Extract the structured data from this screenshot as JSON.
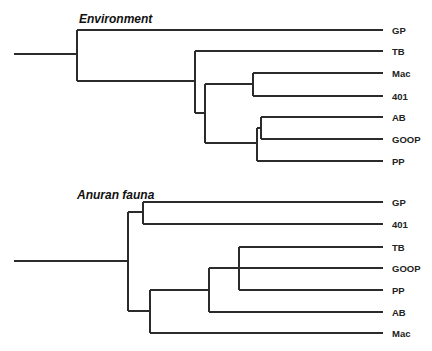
{
  "chart_data": {
    "type": "dendrogram",
    "panels": [
      {
        "id": "environment",
        "title": "Environment",
        "title_pos": [
          79,
          23
        ],
        "root_stem": {
          "x1": 14,
          "x2": 77,
          "y": 54
        },
        "leaf_end_x": 383,
        "label_x": 392,
        "leaves": [
          {
            "name": "GP",
            "y": 30
          },
          {
            "name": "TB",
            "y": 51
          },
          {
            "name": "Mac",
            "y": 73
          },
          {
            "name": "401",
            "y": 96
          },
          {
            "name": "AB",
            "y": 117
          },
          {
            "name": "GOOP",
            "y": 139
          },
          {
            "name": "PP",
            "y": 161
          }
        ],
        "segments": [
          {
            "x1": 77,
            "y1": 30,
            "x2": 77,
            "y2": 81
          },
          {
            "x1": 77,
            "y1": 30,
            "x2": 383,
            "y2": 30
          },
          {
            "x1": 77,
            "y1": 81,
            "x2": 195,
            "y2": 81
          },
          {
            "x1": 195,
            "y1": 51,
            "x2": 195,
            "y2": 113
          },
          {
            "x1": 195,
            "y1": 51,
            "x2": 383,
            "y2": 51
          },
          {
            "x1": 195,
            "y1": 113,
            "x2": 205,
            "y2": 113
          },
          {
            "x1": 205,
            "y1": 84,
            "x2": 205,
            "y2": 143
          },
          {
            "x1": 205,
            "y1": 84,
            "x2": 253,
            "y2": 84
          },
          {
            "x1": 253,
            "y1": 73,
            "x2": 253,
            "y2": 96
          },
          {
            "x1": 253,
            "y1": 73,
            "x2": 383,
            "y2": 73
          },
          {
            "x1": 253,
            "y1": 96,
            "x2": 383,
            "y2": 96
          },
          {
            "x1": 205,
            "y1": 143,
            "x2": 257,
            "y2": 143
          },
          {
            "x1": 257,
            "y1": 128,
            "x2": 257,
            "y2": 161
          },
          {
            "x1": 257,
            "y1": 128,
            "x2": 261,
            "y2": 128
          },
          {
            "x1": 261,
            "y1": 117,
            "x2": 261,
            "y2": 139
          },
          {
            "x1": 261,
            "y1": 117,
            "x2": 383,
            "y2": 117
          },
          {
            "x1": 261,
            "y1": 139,
            "x2": 383,
            "y2": 139
          },
          {
            "x1": 257,
            "y1": 161,
            "x2": 383,
            "y2": 161
          }
        ]
      },
      {
        "id": "anuran-fauna",
        "title": "Anuran fauna",
        "title_pos": [
          77,
          199
        ],
        "root_stem": {
          "x1": 14,
          "x2": 128,
          "y": 261
        },
        "leaf_end_x": 383,
        "label_x": 392,
        "leaves": [
          {
            "name": "GP",
            "y": 202
          },
          {
            "name": "401",
            "y": 224
          },
          {
            "name": "TB",
            "y": 247
          },
          {
            "name": "GOOP",
            "y": 268
          },
          {
            "name": "PP",
            "y": 290
          },
          {
            "name": "AB",
            "y": 312
          },
          {
            "name": "Mac",
            "y": 333
          }
        ],
        "segments": [
          {
            "x1": 128,
            "y1": 212,
            "x2": 128,
            "y2": 311
          },
          {
            "x1": 128,
            "y1": 212,
            "x2": 143,
            "y2": 212
          },
          {
            "x1": 143,
            "y1": 202,
            "x2": 143,
            "y2": 224
          },
          {
            "x1": 143,
            "y1": 202,
            "x2": 383,
            "y2": 202
          },
          {
            "x1": 143,
            "y1": 224,
            "x2": 383,
            "y2": 224
          },
          {
            "x1": 128,
            "y1": 311,
            "x2": 150,
            "y2": 311
          },
          {
            "x1": 150,
            "y1": 290,
            "x2": 150,
            "y2": 333
          },
          {
            "x1": 150,
            "y1": 333,
            "x2": 383,
            "y2": 333
          },
          {
            "x1": 150,
            "y1": 290,
            "x2": 209,
            "y2": 290
          },
          {
            "x1": 209,
            "y1": 268,
            "x2": 209,
            "y2": 312
          },
          {
            "x1": 209,
            "y1": 268,
            "x2": 383,
            "y2": 268
          },
          {
            "x1": 209,
            "y1": 312,
            "x2": 383,
            "y2": 312
          },
          {
            "x1": 239,
            "y1": 247,
            "x2": 239,
            "y2": 290
          },
          {
            "x1": 239,
            "y1": 247,
            "x2": 383,
            "y2": 247
          },
          {
            "x1": 239,
            "y1": 290,
            "x2": 383,
            "y2": 290
          }
        ]
      }
    ]
  }
}
